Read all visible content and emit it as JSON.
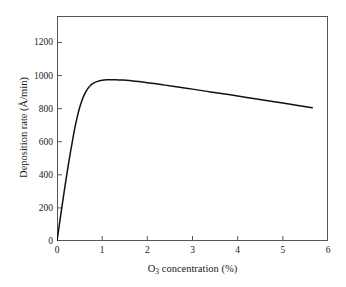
{
  "chart_data": {
    "type": "line",
    "title": "",
    "xlabel": "O3 concentration (%)",
    "xlabel_base": "O",
    "xlabel_sub": "3",
    "xlabel_rest": " concentration (%)",
    "ylabel": "Deposition rate (Å/min)",
    "xlim": [
      0,
      6
    ],
    "ylim": [
      0,
      1360
    ],
    "xticks": [
      0,
      1,
      2,
      3,
      4,
      5,
      6
    ],
    "xtick_labels": [
      "0",
      "1",
      "2",
      "3",
      "4",
      "5",
      "6"
    ],
    "yticks": [
      0,
      200,
      400,
      600,
      800,
      1000,
      1200
    ],
    "ytick_labels": [
      "0",
      "200",
      "400",
      "600",
      "800",
      "1000",
      "1200"
    ],
    "grid": false,
    "legend": "none",
    "line_color": "#111111",
    "frame_color": "#55565a",
    "background": "#ffffff",
    "series": [
      {
        "name": "Deposition rate vs O3 concentration",
        "x": [
          0.0,
          0.05,
          0.1,
          0.15,
          0.2,
          0.25,
          0.3,
          0.35,
          0.4,
          0.45,
          0.5,
          0.55,
          0.6,
          0.65,
          0.7,
          0.75,
          0.8,
          0.9,
          1.0,
          1.1,
          1.2,
          1.3,
          1.45,
          1.6,
          1.8,
          2.0,
          2.3,
          2.6,
          3.0,
          3.4,
          3.8,
          4.2,
          4.6,
          5.0,
          5.3,
          5.65
        ],
        "y": [
          0,
          95,
          190,
          282,
          372,
          458,
          540,
          618,
          690,
          752,
          805,
          848,
          882,
          908,
          928,
          943,
          953,
          965,
          971,
          974,
          975,
          975,
          973,
          970,
          964,
          957,
          946,
          934,
          918,
          901,
          885,
          868,
          851,
          834,
          821,
          805
        ]
      }
    ],
    "annotations": []
  }
}
